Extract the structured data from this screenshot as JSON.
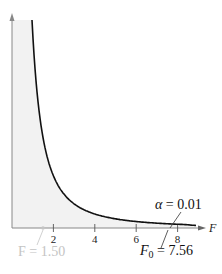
{
  "chart_data": {
    "type": "area",
    "title": "",
    "xlabel": "F",
    "ylabel": "",
    "xlim": [
      0,
      9.3
    ],
    "xticks": [
      2,
      4,
      6,
      8
    ],
    "grid": false,
    "legend": null,
    "series": [
      {
        "name": "F-distribution density",
        "shaded": true,
        "fill_color": "#f2f2f2",
        "line_color": "#111111",
        "x": [
          1.0,
          1.2,
          1.5,
          2.0,
          2.5,
          3.0,
          3.5,
          4.0,
          4.5,
          5.0,
          5.5,
          6.0,
          6.5,
          7.0,
          7.56,
          8.0,
          8.5,
          9.0
        ],
        "y": [
          1.0,
          0.86,
          0.68,
          0.47,
          0.33,
          0.235,
          0.17,
          0.125,
          0.093,
          0.07,
          0.053,
          0.04,
          0.031,
          0.024,
          0.018,
          0.015,
          0.012,
          0.01
        ]
      }
    ],
    "annotations": [
      {
        "text_prefix": "α = ",
        "value": "0.01",
        "full": "α = 0.01",
        "points_to_x": 7.56,
        "region": "right tail"
      },
      {
        "text_prefix": "F",
        "subscript": "0",
        "value": "7.56",
        "full": "F0 = 7.56",
        "points_to_x": 7.56,
        "role": "critical value"
      },
      {
        "text_prefix": "F = ",
        "value": "1.50",
        "full": "F = 1.50",
        "points_to_x": 1.5,
        "role": "test statistic",
        "faint": true
      }
    ]
  },
  "labels": {
    "x_axis": "F",
    "ticks": [
      "2",
      "4",
      "6",
      "8"
    ],
    "alpha_symbol": "α",
    "alpha_eq": " = 0.01",
    "f0_main": "F",
    "f0_sub": "0",
    "f0_eq": " = 7.56",
    "f_stat": "F = 1.50"
  },
  "colors": {
    "fill": "#f2f2f2",
    "curve": "#111111",
    "axis": "#888888",
    "faint": "#c4c4c4"
  }
}
